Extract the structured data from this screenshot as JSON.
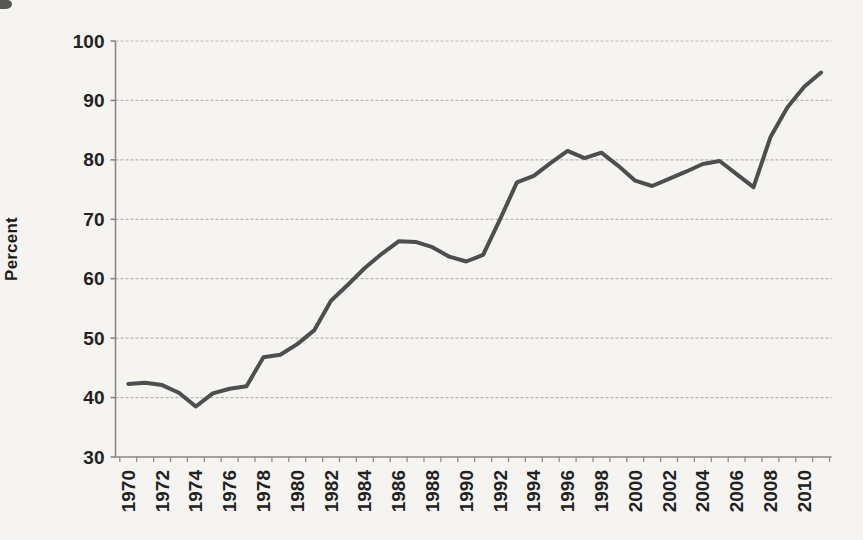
{
  "figure": {
    "title": "",
    "y_axis_title": "Percent"
  },
  "chart_data": {
    "type": "line",
    "title": "",
    "xlabel": "",
    "ylabel": "Percent",
    "x": [
      1970,
      1971,
      1972,
      1973,
      1974,
      1975,
      1976,
      1977,
      1978,
      1979,
      1980,
      1981,
      1982,
      1983,
      1984,
      1985,
      1986,
      1987,
      1988,
      1989,
      1990,
      1991,
      1992,
      1993,
      1994,
      1995,
      1996,
      1997,
      1998,
      1999,
      2000,
      2001,
      2002,
      2003,
      2004,
      2005,
      2006,
      2007,
      2008,
      2009,
      2010,
      2011
    ],
    "values": [
      42.3,
      42.5,
      42.1,
      40.8,
      38.5,
      40.7,
      41.5,
      41.9,
      46.8,
      47.2,
      49.0,
      51.3,
      56.3,
      59.0,
      61.8,
      64.2,
      66.3,
      66.2,
      65.3,
      63.7,
      62.9,
      64.0,
      70.0,
      76.2,
      77.3,
      79.5,
      81.5,
      80.3,
      81.2,
      79.0,
      76.5,
      75.6,
      76.8,
      78.0,
      79.3,
      79.8,
      77.6,
      75.4,
      83.8,
      88.8,
      92.3,
      94.7
    ],
    "ylim": [
      30,
      100
    ],
    "ytick_step": 10,
    "ytick_labels": [
      "30",
      "40",
      "50",
      "60",
      "70",
      "80",
      "90",
      "100"
    ],
    "xtick_label_step": 2,
    "xtick_labels": [
      "1970",
      "1972",
      "1974",
      "1976",
      "1978",
      "1980",
      "1982",
      "1984",
      "1986",
      "1988",
      "1990",
      "1992",
      "1994",
      "1996",
      "1998",
      "2000",
      "2002",
      "2004",
      "2006",
      "2008",
      "2010"
    ],
    "grid": true,
    "legend_position": "none",
    "colors": {
      "line": "#4e4e50",
      "grid": "#b3b1ac",
      "axis": "#8a8883",
      "text": "#222222",
      "background": "#f5f4f1"
    }
  }
}
